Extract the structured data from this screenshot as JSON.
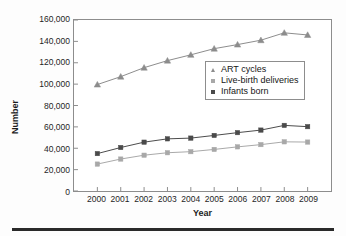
{
  "chart_data": {
    "type": "line",
    "title": "",
    "xlabel": "Year",
    "ylabel": "Number",
    "grid": false,
    "legend_position": "center-right",
    "categories": [
      "2000",
      "2001",
      "2002",
      "2003",
      "2004",
      "2005",
      "2006",
      "2007",
      "2008",
      "2009"
    ],
    "x": [
      2000,
      2001,
      2002,
      2003,
      2004,
      2005,
      2006,
      2007,
      2008,
      2009
    ],
    "xlim": [
      1999.5,
      2009.5
    ],
    "ylim": [
      0,
      160000
    ],
    "yticks": [
      0,
      20000,
      40000,
      60000,
      80000,
      100000,
      120000,
      140000,
      160000
    ],
    "ytick_labels": [
      "0",
      "20,000",
      "40,000",
      "60,000",
      "80,000",
      "100,000",
      "120,000",
      "140,000",
      "160,000"
    ],
    "series": [
      {
        "name": "ART cycles",
        "marker": "triangle",
        "color": "#8c8c8c",
        "values": [
          99600,
          107000,
          115400,
          122000,
          127400,
          133200,
          137000,
          141100,
          148000,
          146000
        ]
      },
      {
        "name": "Live-birth deliveries",
        "marker": "square",
        "color": "#a8a8a8",
        "values": [
          25200,
          29900,
          33500,
          35800,
          36800,
          38900,
          41300,
          43400,
          46000,
          45800
        ]
      },
      {
        "name": "Infants born",
        "marker": "square",
        "color": "#4a4a4a",
        "values": [
          35000,
          40700,
          45700,
          48800,
          49500,
          52000,
          54600,
          57000,
          61400,
          60200
        ]
      }
    ]
  },
  "legend": {
    "items": [
      {
        "label": "ART cycles",
        "marker": "triangle-marker",
        "color": "#8c8c8c"
      },
      {
        "label": "Live-birth deliveries",
        "marker": "square-marker",
        "color": "#a8a8a8"
      },
      {
        "label": "Infants born",
        "marker": "square-marker",
        "color": "#4a4a4a"
      }
    ]
  },
  "axes": {
    "y_title": "Number",
    "x_title": "Year"
  }
}
